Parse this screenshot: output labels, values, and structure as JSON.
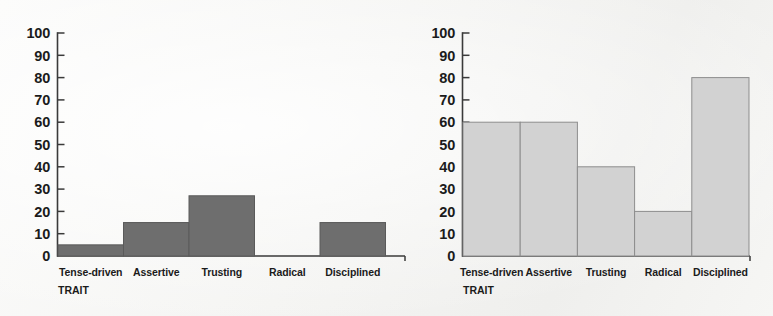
{
  "chart_data": [
    {
      "panel": "left",
      "type": "bar",
      "title": "",
      "xlabel": "TRAIT",
      "ylabel": "",
      "categories": [
        "Tense-driven",
        "Assertive",
        "Trusting",
        "Radical",
        "Disciplined"
      ],
      "values": [
        5,
        15,
        27,
        0,
        15
      ],
      "ylim": [
        0,
        100
      ],
      "yticks": [
        0,
        10,
        20,
        30,
        40,
        50,
        60,
        70,
        80,
        90,
        100
      ],
      "ytick_labels": [
        "0",
        "10",
        "20",
        "30",
        "40",
        "50",
        "60",
        "70",
        "80",
        "90",
        "100"
      ],
      "grid": false,
      "legend": "none",
      "bar_fill": "#6e6e6e",
      "bar_stroke": "#5a5a5a",
      "axis_color": "#3a3a3a",
      "bar_style": "adjacent-histogram"
    },
    {
      "panel": "right",
      "type": "bar",
      "title": "",
      "xlabel": "TRAIT",
      "ylabel": "",
      "categories": [
        "Tense-driven",
        "Assertive",
        "Trusting",
        "Radical",
        "Disciplined"
      ],
      "values": [
        60,
        60,
        40,
        20,
        80
      ],
      "ylim": [
        0,
        100
      ],
      "yticks": [
        0,
        10,
        20,
        30,
        40,
        50,
        60,
        70,
        80,
        90,
        100
      ],
      "ytick_labels": [
        "0",
        "10",
        "20",
        "30",
        "40",
        "50",
        "60",
        "70",
        "80",
        "90",
        "100"
      ],
      "grid": false,
      "legend": "none",
      "bar_fill": "#d2d2d2",
      "bar_stroke": "#8d8d8d",
      "axis_color": "#3a3a3a",
      "bar_style": "adjacent-histogram"
    }
  ],
  "page": {
    "background_color": "#f5f5f3",
    "text_color": "#1b1b1b"
  }
}
